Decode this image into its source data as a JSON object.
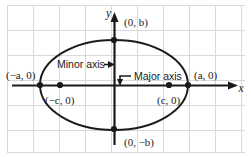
{
  "figure": {
    "axes": {
      "x_label": "x",
      "y_label": "y"
    },
    "annotations": {
      "minor_axis_label": "Minor axis",
      "major_axis_label": "Major axis"
    },
    "points": [
      {
        "name": "top-co-vertex",
        "label": "(0, b)",
        "x": 114,
        "y": 40
      },
      {
        "name": "bottom-co-vertex",
        "label": "(0, −b)",
        "x": 114,
        "y": 129
      },
      {
        "name": "left-vertex",
        "label": "(−a, 0)",
        "x": 39,
        "y": 85
      },
      {
        "name": "right-vertex",
        "label": "(a, 0)",
        "x": 188,
        "y": 85
      },
      {
        "name": "left-focus",
        "label": "(−c, 0)",
        "x": 60,
        "y": 85
      },
      {
        "name": "right-focus",
        "label": "(c, 0)",
        "x": 169,
        "y": 85
      }
    ],
    "ellipse": {
      "center_x": 114,
      "center_y": 85,
      "semi_major_a": 74,
      "semi_minor_b": 45
    },
    "colors": {
      "grid": "#d8d8dc",
      "ink": "#1a1a1a",
      "background": "#ffffff"
    }
  }
}
